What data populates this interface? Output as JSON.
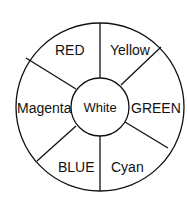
{
  "diagram": {
    "type": "color-wheel",
    "center": {
      "label": "White"
    },
    "segments": [
      {
        "label": "RED"
      },
      {
        "label": "Yellow"
      },
      {
        "label": "GREEN"
      },
      {
        "label": "Cyan"
      },
      {
        "label": "BLUE"
      },
      {
        "label": "Magenta"
      }
    ],
    "colors": {
      "stroke": "#111111",
      "background": "#ffffff",
      "text": "#111111"
    }
  }
}
